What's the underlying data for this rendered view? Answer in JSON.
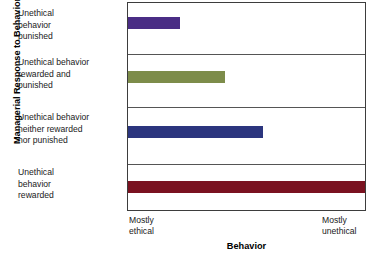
{
  "chart_data": {
    "type": "bar",
    "orientation": "horizontal",
    "title": "",
    "xlabel": "Behavior",
    "ylabel": "Managerial Response to Behavior",
    "categories": [
      "Unethical behavior punished",
      "Unethical behavior rewarded and punished",
      "Unethical behavior neither rewarded nor punished",
      "Unethical behavior rewarded"
    ],
    "values": [
      22,
      41,
      57,
      100
    ],
    "value_unit": "percent of axis span",
    "xlim": [
      0,
      100
    ],
    "x_tick_labels": [
      "Mostly ethical",
      "Mostly unethical"
    ],
    "grid": false,
    "legend": "none",
    "bar_colors": [
      "#4a2d85",
      "#7d8c4a",
      "#2b357e",
      "#7a1220"
    ]
  },
  "axes": {
    "y_title": "Managerial Response to Behavior",
    "x_title": "Behavior",
    "x_tick_left_line1": "Mostly",
    "x_tick_left_line2": "ethical",
    "x_tick_right_line1": "Mostly",
    "x_tick_right_line2": "unethical"
  },
  "categories": [
    {
      "id": "punished",
      "lines": [
        "Unethical",
        "behavior",
        "punished"
      ],
      "value": 22,
      "color": "#4a2d85"
    },
    {
      "id": "rewarded-and-punished",
      "lines": [
        "Unethical behavior",
        "rewarded and",
        "punished"
      ],
      "value": 41,
      "color": "#7d8c4a"
    },
    {
      "id": "neither-rewarded-nor-punished",
      "lines": [
        "Unethical behavior",
        "neither rewarded",
        "nor punished"
      ],
      "value": 57,
      "color": "#2b357e"
    },
    {
      "id": "rewarded",
      "lines": [
        "Unethical",
        "behavior",
        "rewarded"
      ],
      "value": 100,
      "color": "#7a1220"
    }
  ]
}
